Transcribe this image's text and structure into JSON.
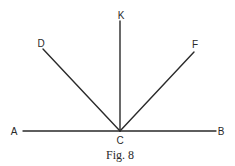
{
  "figure": {
    "caption": "Fig. 8",
    "vertex": "C",
    "line_color": "#2a2a2a"
  },
  "points": {
    "A": {
      "label": "A",
      "x": 17,
      "y": 131
    },
    "B": {
      "label": "B",
      "x": 220,
      "y": 131
    },
    "C": {
      "label": "C",
      "x": 120,
      "y": 131
    },
    "D": {
      "label": "D",
      "x": 43,
      "y": 49
    },
    "K": {
      "label": "K",
      "x": 120,
      "y": 21
    },
    "F": {
      "label": "F",
      "x": 194,
      "y": 52
    }
  },
  "segments": [
    {
      "name": "AB",
      "from": "A",
      "to": "B"
    },
    {
      "name": "CD",
      "from": "C",
      "to": "D"
    },
    {
      "name": "CK",
      "from": "C",
      "to": "K"
    },
    {
      "name": "CF",
      "from": "C",
      "to": "F"
    }
  ]
}
